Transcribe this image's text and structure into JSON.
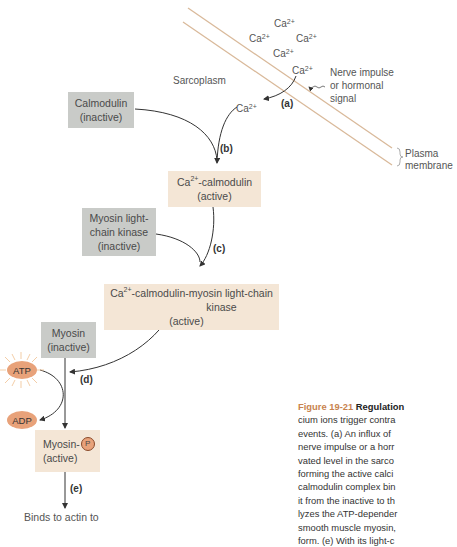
{
  "diagram": {
    "region_label": "Sarcoplasm",
    "ions": [
      {
        "base": "Ca",
        "charge": "2+"
      },
      {
        "base": "Ca",
        "charge": "2+"
      },
      {
        "base": "Ca",
        "charge": "2+"
      },
      {
        "base": "Ca",
        "charge": "2+"
      },
      {
        "base": "Ca",
        "charge": "2+"
      },
      {
        "base": "Ca",
        "charge": "2+"
      }
    ],
    "signal_label": [
      "Nerve impulse",
      "or hormonal",
      "signal"
    ],
    "membrane_label": [
      "Plasma",
      "membrane"
    ],
    "steps": [
      "(a)",
      "(b)",
      "(c)",
      "(d)",
      "(e)"
    ],
    "nodes": {
      "calmodulin": {
        "line1": "Calmodulin",
        "line2": "(inactive)"
      },
      "ca_calmodulin": {
        "prefix": "Ca",
        "charge": "2+",
        "line1": "-calmodulin",
        "line2": "(active)"
      },
      "mlck": {
        "line1": "Myosin light-",
        "line2": "chain kinase",
        "line3": "(inactive)"
      },
      "complex": {
        "prefix": "Ca",
        "charge": "2+",
        "line1": "-calmodulin-myosin light-chain",
        "line2": "kinase",
        "line3": "(active)"
      },
      "myosin_inactive": {
        "line1": "Myosin",
        "line2": "(inactive)"
      },
      "atp": "ATP",
      "adp": "ADP",
      "myosin_active": {
        "line1": "Myosin-",
        "phosphate": "P",
        "line2": "(active)"
      },
      "outcome": "Binds to actin to"
    },
    "colors": {
      "inactive_box": "#c9cbc8",
      "active_box": "#f4e6d6",
      "nucleotide": "#e8a27a",
      "membrane": "#d9b99a",
      "figure_label": "#c8834e"
    }
  },
  "caption": {
    "figure": "Figure 19-21",
    "title": "Regulation",
    "lines": [
      "cium ions trigger contra",
      "events. (a) An influx of",
      "nerve impulse or a horr",
      "vated level in the sarco",
      "forming the active calci",
      "calmodulin complex bin",
      "it from the inactive to th",
      "lyzes the ATP-depender",
      "smooth muscle myosin,",
      "form. (e) With its light-c"
    ]
  }
}
